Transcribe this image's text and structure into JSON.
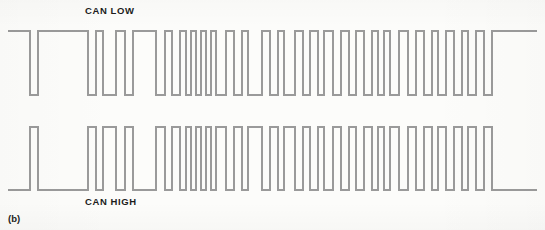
{
  "figure": {
    "caption": "(b)",
    "width": 545,
    "height": 230,
    "background_color": "#fcfcfa",
    "trace_color": "#9a9a9a",
    "trace_width": 2,
    "text_color": "#1c1c1c"
  },
  "labels": {
    "can_low": "CAN LOW",
    "can_high": "CAN HIGH"
  },
  "chart_data": {
    "type": "line",
    "title": "(b)",
    "subtitle": "CAN bus differential signal pair",
    "xlabel": "",
    "ylabel": "",
    "grid": false,
    "legend_position": "inline-labels",
    "x_range": [
      8,
      537
    ],
    "series": [
      {
        "name": "CAN LOW",
        "label_text": "CAN LOW",
        "color": "#9a9a9a",
        "y_high_px": 31,
        "y_low_px": 95,
        "start_level": 1,
        "x_start": 8,
        "x_end": 537,
        "transitions_px": [
          30,
          38,
          88,
          96,
          103,
          116,
          125,
          133,
          156,
          165,
          172,
          180,
          186,
          191,
          196,
          201,
          206,
          211,
          216,
          226,
          234,
          242,
          248,
          262,
          270,
          278,
          284,
          295,
          303,
          310,
          318,
          324,
          333,
          341,
          349,
          356,
          364,
          372,
          378,
          384,
          390,
          399,
          408,
          416,
          424,
          432,
          438,
          446,
          454,
          462,
          468,
          476,
          484,
          492
        ]
      },
      {
        "name": "CAN HIGH",
        "label_text": "CAN HIGH",
        "color": "#9a9a9a",
        "y_high_px": 127,
        "y_low_px": 190,
        "start_level": 0,
        "x_start": 8,
        "x_end": 537,
        "inverse_of": "CAN LOW",
        "transitions_px": [
          30,
          38,
          88,
          96,
          103,
          116,
          125,
          133,
          156,
          165,
          172,
          180,
          186,
          191,
          196,
          201,
          206,
          211,
          216,
          226,
          234,
          242,
          248,
          262,
          270,
          278,
          284,
          295,
          303,
          310,
          318,
          324,
          333,
          341,
          349,
          356,
          364,
          372,
          378,
          384,
          390,
          399,
          408,
          416,
          424,
          432,
          438,
          446,
          454,
          462,
          468,
          476,
          484,
          492
        ]
      }
    ]
  }
}
